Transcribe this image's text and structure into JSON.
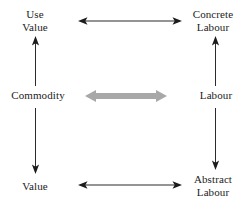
{
  "diagram": {
    "nodes": [
      {
        "id": "use_value",
        "label": "Use\nValue",
        "position": "top-left"
      },
      {
        "id": "concrete_labour",
        "label": "Concrete\nLabour",
        "position": "top-right"
      },
      {
        "id": "commodity",
        "label": "Commodity",
        "position": "middle-left"
      },
      {
        "id": "labour",
        "label": "Labour",
        "position": "middle-right"
      },
      {
        "id": "value",
        "label": "Value",
        "position": "bottom-left"
      },
      {
        "id": "abstract_labour",
        "label": "Abstract\nLabour",
        "position": "bottom-right"
      }
    ],
    "edges": [
      {
        "id": "commodity_to_use_value",
        "from": "commodity",
        "to": "use_value",
        "direction": "up",
        "style": "thin",
        "color": "#2b2b2b"
      },
      {
        "id": "commodity_to_value",
        "from": "commodity",
        "to": "value",
        "direction": "down",
        "style": "thin",
        "color": "#2b2b2b"
      },
      {
        "id": "labour_to_concrete_labour",
        "from": "labour",
        "to": "concrete_labour",
        "direction": "up",
        "style": "thin",
        "color": "#2b2b2b"
      },
      {
        "id": "labour_to_abstract_labour",
        "from": "labour",
        "to": "abstract_labour",
        "direction": "down",
        "style": "thin",
        "color": "#2b2b2b"
      },
      {
        "id": "use_value_concrete_labour",
        "from": "use_value",
        "to": "concrete_labour",
        "direction": "bidirectional",
        "style": "thin",
        "color": "#2b2b2b"
      },
      {
        "id": "commodity_labour",
        "from": "commodity",
        "to": "labour",
        "direction": "bidirectional",
        "style": "thick",
        "color": "#a8a8a8"
      },
      {
        "id": "value_abstract_labour",
        "from": "value",
        "to": "abstract_labour",
        "direction": "bidirectional",
        "style": "thin",
        "color": "#2b2b2b"
      }
    ],
    "colors": {
      "background": "#ffffff",
      "text": "#1c1c1c",
      "arrow_thin": "#2b2b2b",
      "arrow_thick": "#a8a8a8"
    }
  }
}
